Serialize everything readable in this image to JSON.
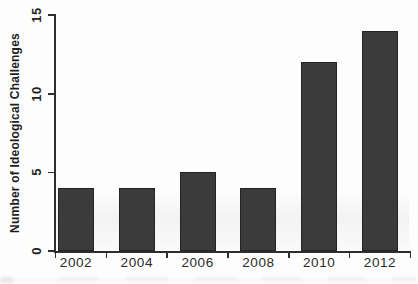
{
  "figure": {
    "background_color": "#fdfdfd",
    "bar_color": "#3b3b3b",
    "axis_color": "#2e2e2e",
    "text_color": "#242424"
  },
  "chart_data": {
    "type": "bar",
    "title": "",
    "xlabel": "",
    "ylabel": "Number of Ideological Challenges",
    "categories": [
      "2002",
      "2004",
      "2006",
      "2008",
      "2010",
      "2012"
    ],
    "values": [
      4,
      4,
      5,
      4,
      12,
      14
    ],
    "yticks": [
      0,
      5,
      10,
      15
    ],
    "ylim": [
      0,
      15
    ],
    "grid": false,
    "legend": false,
    "bar_orientation": "vertical",
    "ytick_label_rotation_deg": 90
  }
}
